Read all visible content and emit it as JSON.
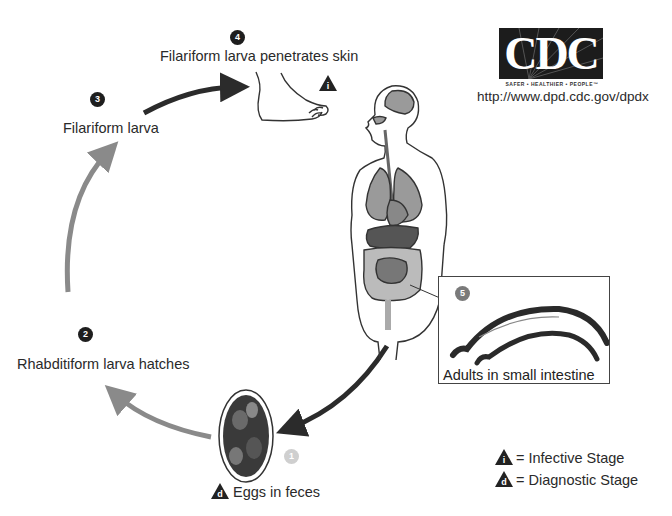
{
  "logo": {
    "text": "CDC",
    "tagline": "SAFER • HEALTHIER • PEOPLE™"
  },
  "url": "http://www.dpd.cdc.gov/dpdx",
  "stages": [
    {
      "number": "1",
      "label": "Eggs in feces",
      "marker": "d"
    },
    {
      "number": "2",
      "label": "Rhabditiform larva hatches"
    },
    {
      "number": "3",
      "label": "Filariform larva"
    },
    {
      "number": "4",
      "label": "Filariform larva penetrates skin",
      "marker": "i"
    },
    {
      "number": "5",
      "label": "Adults in small intestine"
    }
  ],
  "legend": [
    {
      "marker": "i",
      "text": "= Infective Stage"
    },
    {
      "marker": "d",
      "text": "= Diagnostic Stage"
    }
  ],
  "colors": {
    "dark_arrow": "#2b2b2b",
    "gray_arrow": "#8a8a8a",
    "organ_gray": "#9a9a9a"
  }
}
